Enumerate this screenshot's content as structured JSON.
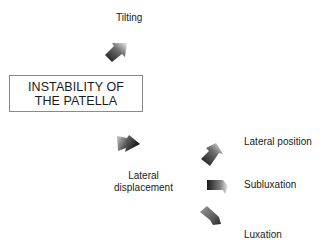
{
  "diagram": {
    "main_concept": {
      "line1": "INSTABILITY OF",
      "line2": "THE PATELLA"
    },
    "branches": [
      {
        "label": "Tilting",
        "arrow": "arrow-up-right-icon"
      },
      {
        "label_line1": "Lateral",
        "label_line2": "displacement",
        "arrow": "arrow-down-right-icon"
      }
    ],
    "sub_branches": [
      {
        "label": "Lateral position",
        "arrow": "arrow-up-right-icon"
      },
      {
        "label": "Subluxation",
        "arrow": "arrow-right-icon"
      },
      {
        "label": "Luxation",
        "arrow": "arrow-down-right-icon"
      }
    ],
    "colors": {
      "arrow_dark": "#1e1e1e",
      "arrow_light": "#e6e6e6",
      "border": "#8a8a8a",
      "text": "#1a1a1a"
    }
  }
}
